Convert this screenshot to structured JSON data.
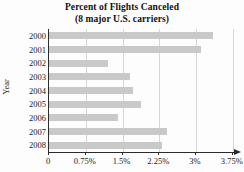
{
  "chart_data": {
    "type": "bar",
    "orientation": "horizontal",
    "title": "Percent of Flights Canceled",
    "subtitle": "(8 major U.S. carriers)",
    "xlabel": "",
    "ylabel": "Year",
    "categories": [
      "2000",
      "2001",
      "2002",
      "2003",
      "2004",
      "2005",
      "2006",
      "2007",
      "2008"
    ],
    "values": [
      3.35,
      3.1,
      1.2,
      1.65,
      1.72,
      1.87,
      1.4,
      2.4,
      2.3
    ],
    "xlim": [
      0,
      4.0
    ],
    "ylim": null,
    "xticks": [
      0,
      0.75,
      1.5,
      2.25,
      3,
      3.75
    ],
    "xtick_labels": [
      "0",
      "0.75%",
      "1.5%",
      "2.25%",
      "3%",
      "3.75%"
    ],
    "grid": "vertical",
    "legend": null,
    "bar_color": "#c9c9c9",
    "axis_color": "#2b2b2b",
    "gridline_color": "#d6d6d6",
    "background_color": "#fdfdfd"
  }
}
